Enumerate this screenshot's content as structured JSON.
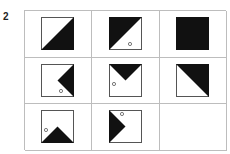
{
  "question": {
    "number": "2"
  },
  "puzzle": {
    "rows": 3,
    "cols": 3,
    "cells": [
      {
        "id": "r1c1",
        "shape": "triangle-bottom-right",
        "dot": null
      },
      {
        "id": "r1c2",
        "shape": "triangle-top-left",
        "dot": "bottom-right"
      },
      {
        "id": "r1c3",
        "shape": "filled-square",
        "dot": null
      },
      {
        "id": "r2c1",
        "shape": "triangle-right-pointing-left",
        "dot": "bottom-right"
      },
      {
        "id": "r2c2",
        "shape": "triangle-top-pointing-down",
        "dot": "left"
      },
      {
        "id": "r2c3",
        "shape": "triangle-top-right",
        "dot": null
      },
      {
        "id": "r3c1",
        "shape": "triangle-bottom-pointing-up",
        "dot": "left"
      },
      {
        "id": "r3c2",
        "shape": "triangle-left-pointing-right",
        "dot": "top"
      },
      {
        "id": "r3c3",
        "shape": "empty",
        "dot": null
      }
    ],
    "colors": {
      "fill": "#111111",
      "border": "#555555",
      "grid": "#bdbdbd"
    }
  }
}
